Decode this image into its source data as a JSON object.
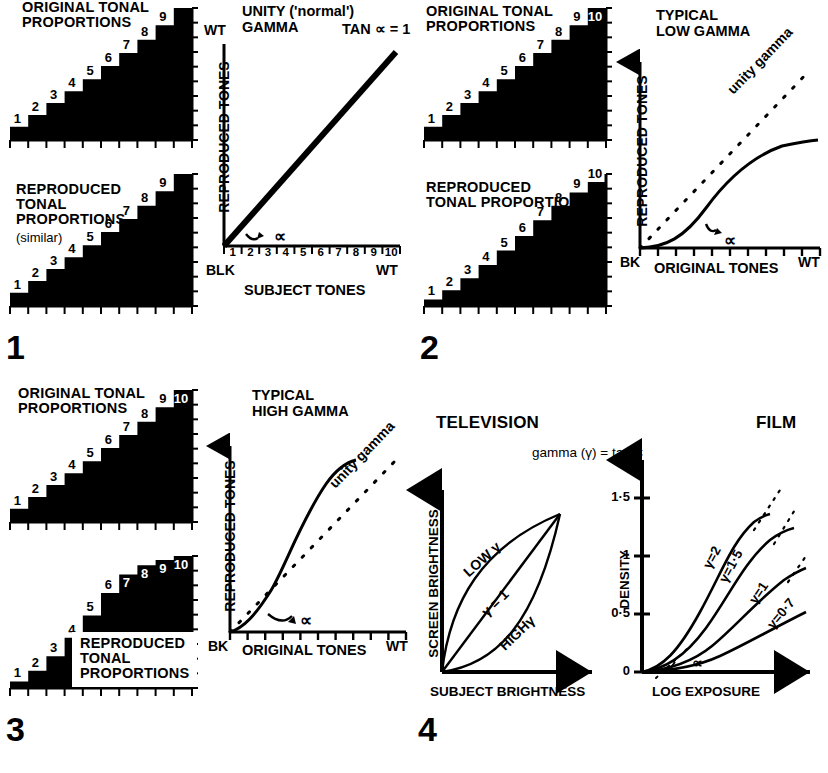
{
  "figure": {
    "caption_absent": true
  },
  "panels": [
    {
      "number": "1",
      "original_wedge": {
        "title": "ORIGINAL TONAL\nPROPORTIONS",
        "step_labels": [
          "1",
          "2",
          "3",
          "4",
          "5",
          "6",
          "7",
          "8",
          "9"
        ],
        "white_labels_from": 10
      },
      "reproduced_wedge": {
        "title": "REPRODUCED\nTONAL\nPROPORTIONS",
        "subtitle": "(similar)",
        "step_labels": [
          "1",
          "2",
          "3",
          "4",
          "5",
          "6",
          "7",
          "8",
          "9"
        ]
      },
      "chart": {
        "title": "UNITY ('normal')\nGAMMA",
        "equation": "TAN ∝ = 1",
        "ylabel": "REPRODUCED TONES",
        "xlabel": "SUBJECT TONES",
        "y_top": "WT",
        "x_start": "BLK",
        "x_end": "WT",
        "x_ticklabels": [
          "1",
          "2",
          "3",
          "4",
          "5",
          "6",
          "7",
          "8",
          "9",
          "10"
        ],
        "angle_label": "∝"
      }
    },
    {
      "number": "2",
      "original_wedge": {
        "title": "ORIGINAL TONAL\nPROPORTIONS",
        "step_labels": [
          "1",
          "2",
          "3",
          "4",
          "5",
          "6",
          "7",
          "8",
          "9",
          "10"
        ]
      },
      "reproduced_wedge": {
        "title": "REPRODUCED\nTONAL PROPORTIONS",
        "step_labels": [
          "1",
          "2",
          "3",
          "4",
          "5",
          "6",
          "7",
          "8",
          "9",
          "10"
        ]
      },
      "chart": {
        "title": "TYPICAL\nLOW GAMMA",
        "ylabel": "REPRODUCED TONES",
        "xlabel": "ORIGINAL TONES",
        "x_start": "BK",
        "x_end": "WT",
        "reference_line_label": "unity gamma",
        "angle_label": "∝"
      }
    },
    {
      "number": "3",
      "original_wedge": {
        "title": "ORIGINAL TONAL\nPROPORTIONS",
        "step_labels": [
          "1",
          "2",
          "3",
          "4",
          "5",
          "6",
          "7",
          "8",
          "9",
          "10"
        ]
      },
      "reproduced_wedge": {
        "title": "REPRODUCED\nTONAL\nPROPORTIONS",
        "step_labels": [
          "1",
          "2",
          "3",
          "4",
          "5",
          "6",
          "7",
          "8",
          "9",
          "10"
        ]
      },
      "chart": {
        "title": "TYPICAL\nHIGH GAMMA",
        "ylabel": "REPRODUCED TONES",
        "xlabel": "ORIGINAL TONES",
        "x_start": "BK",
        "x_end": "WT",
        "reference_line_label": "unity gamma",
        "angle_label": "∝"
      }
    },
    {
      "number": "4",
      "heading_left": "TELEVISION",
      "heading_right": "FILM",
      "equation": "gamma (γ) = tan ∝",
      "tv_chart": {
        "ylabel": "SCREEN BRIGHTNESS",
        "xlabel": "SUBJECT BRIGHTNESS",
        "curve_labels": [
          "LOW γ",
          "γ = 1",
          "HIGHγ"
        ]
      },
      "film_chart": {
        "ylabel": "DENSITY",
        "xlabel": "LOG EXPOSURE",
        "y_ticklabels": [
          "0",
          "0·5",
          "1",
          "1·5"
        ],
        "curve_labels": [
          "γ=2",
          "γ=1·5",
          "γ=1",
          "γ=0·7"
        ],
        "angle_label": "∝"
      }
    }
  ],
  "chart_data": [
    {
      "type": "line",
      "panel": 1,
      "title": "UNITY ('normal') GAMMA",
      "xlabel": "SUBJECT TONES",
      "ylabel": "REPRODUCED TONES",
      "xlim": [
        0,
        10
      ],
      "ylim": [
        0,
        10
      ],
      "grid": false,
      "x_ticklabels": [
        "1",
        "2",
        "3",
        "4",
        "5",
        "6",
        "7",
        "8",
        "9",
        "10"
      ],
      "series": [
        {
          "name": "unity gamma (tan ∝ = 1)",
          "style": "solid",
          "x": [
            0,
            1,
            2,
            3,
            4,
            5,
            6,
            7,
            8,
            9,
            10
          ],
          "values": [
            0,
            1,
            2,
            3,
            4,
            5,
            6,
            7,
            8,
            9,
            10
          ]
        }
      ],
      "annotations": [
        "TAN ∝ = 1",
        "∝",
        "BLK",
        "WT"
      ]
    },
    {
      "type": "line",
      "panel": 2,
      "title": "TYPICAL LOW GAMMA",
      "xlabel": "ORIGINAL TONES",
      "ylabel": "REPRODUCED TONES",
      "xlim": [
        0,
        10
      ],
      "ylim": [
        0,
        10
      ],
      "grid": false,
      "series": [
        {
          "name": "unity gamma",
          "style": "dotted",
          "x": [
            0,
            2,
            4,
            6,
            8,
            10
          ],
          "values": [
            0,
            2,
            4,
            6,
            8,
            10
          ]
        },
        {
          "name": "low gamma response",
          "style": "solid",
          "x": [
            0,
            1,
            2,
            3,
            4,
            5,
            6,
            7,
            8,
            9,
            10
          ],
          "values": [
            0,
            0.15,
            0.6,
            1.3,
            2.1,
            3.0,
            3.9,
            4.7,
            5.3,
            5.6,
            5.7
          ]
        }
      ],
      "annotations": [
        "unity gamma",
        "∝",
        "BK",
        "WT"
      ]
    },
    {
      "type": "line",
      "panel": 3,
      "title": "TYPICAL HIGH GAMMA",
      "xlabel": "ORIGINAL TONES",
      "ylabel": "REPRODUCED TONES",
      "xlim": [
        0,
        10
      ],
      "ylim": [
        0,
        10
      ],
      "grid": false,
      "series": [
        {
          "name": "unity gamma",
          "style": "dotted",
          "x": [
            0,
            2,
            4,
            6,
            8,
            10
          ],
          "values": [
            0,
            2,
            4,
            6,
            8,
            10
          ]
        },
        {
          "name": "high gamma response",
          "style": "solid",
          "x": [
            0,
            1,
            2,
            3,
            4,
            5,
            6,
            7,
            8,
            9,
            10
          ],
          "values": [
            0,
            0.7,
            1.9,
            3.6,
            5.4,
            7.0,
            8.2,
            8.9,
            9.2,
            9.25,
            9.2
          ]
        }
      ],
      "annotations": [
        "unity gamma",
        "∝",
        "BK",
        "WT"
      ]
    },
    {
      "type": "line",
      "panel": 4,
      "subplot": "TELEVISION",
      "xlabel": "SUBJECT BRIGHTNESS",
      "ylabel": "SCREEN BRIGHTNESS",
      "xlim": [
        0,
        10
      ],
      "ylim": [
        0,
        10
      ],
      "grid": false,
      "series": [
        {
          "name": "LOW γ",
          "style": "solid",
          "x": [
            0,
            1,
            2,
            3,
            4,
            5,
            6,
            7,
            8,
            9,
            10
          ],
          "values": [
            0,
            2.2,
            3.9,
            5.3,
            6.4,
            7.3,
            8.1,
            8.7,
            9.2,
            9.6,
            10
          ]
        },
        {
          "name": "γ = 1",
          "style": "solid",
          "x": [
            0,
            10
          ],
          "values": [
            0,
            10
          ]
        },
        {
          "name": "HIGHγ",
          "style": "solid",
          "x": [
            0,
            1,
            2,
            3,
            4,
            5,
            6,
            7,
            8,
            9,
            10
          ],
          "values": [
            0,
            0.25,
            0.65,
            1.2,
            1.9,
            2.8,
            3.9,
            5.2,
            6.7,
            8.3,
            10
          ]
        }
      ]
    },
    {
      "type": "line",
      "panel": 4,
      "subplot": "FILM",
      "xlabel": "LOG EXPOSURE",
      "ylabel": "DENSITY",
      "ylim": [
        0,
        1.7
      ],
      "y_ticks": [
        0,
        0.5,
        1,
        1.5
      ],
      "y_ticklabels": [
        "0",
        "0·5",
        "1",
        "1·5"
      ],
      "grid": false,
      "series": [
        {
          "name": "γ=2",
          "style": "solid",
          "x": [
            0,
            1,
            2,
            3,
            4,
            5,
            6,
            7
          ],
          "values": [
            0,
            0.06,
            0.22,
            0.55,
            0.95,
            1.28,
            1.42,
            1.45
          ]
        },
        {
          "name": "γ=1·5",
          "style": "solid",
          "x": [
            0,
            1,
            2,
            3,
            4,
            5,
            6,
            7,
            8
          ],
          "values": [
            0,
            0.05,
            0.17,
            0.4,
            0.7,
            0.98,
            1.18,
            1.3,
            1.34
          ]
        },
        {
          "name": "γ=1",
          "style": "solid",
          "x": [
            0,
            1,
            2,
            3,
            4,
            5,
            6,
            7,
            8,
            9
          ],
          "values": [
            0,
            0.04,
            0.12,
            0.26,
            0.44,
            0.62,
            0.78,
            0.9,
            0.98,
            1.02
          ]
        },
        {
          "name": "γ=0·7",
          "style": "solid",
          "x": [
            0,
            1,
            2,
            3,
            4,
            5,
            6,
            7,
            8,
            9
          ],
          "values": [
            0,
            0.03,
            0.08,
            0.17,
            0.28,
            0.4,
            0.51,
            0.61,
            0.7,
            0.77
          ]
        }
      ],
      "annotations": [
        "∝"
      ]
    }
  ],
  "wedge_steps": {
    "original": [
      0.1,
      0.19,
      0.28,
      0.37,
      0.46,
      0.56,
      0.66,
      0.76,
      0.87,
      1.0
    ],
    "reproduced_similar": [
      0.1,
      0.19,
      0.28,
      0.37,
      0.46,
      0.56,
      0.66,
      0.76,
      0.87,
      1.0
    ],
    "reproduced_low": [
      0.05,
      0.12,
      0.21,
      0.31,
      0.42,
      0.53,
      0.65,
      0.76,
      0.86,
      0.94
    ],
    "reproduced_high": [
      0.05,
      0.13,
      0.24,
      0.38,
      0.55,
      0.72,
      0.86,
      0.93,
      0.97,
      1.0
    ]
  }
}
